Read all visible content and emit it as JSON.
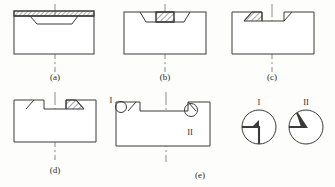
{
  "figure": {
    "title": "",
    "panels": [
      {
        "id": "a",
        "label": "(a)",
        "label_x": 55,
        "label_y": 80,
        "desc": "blank with full-width hatched top layer and trapezoidal preform outline",
        "body": {
          "x": 14,
          "y": 16,
          "w": 80,
          "h": 38
        },
        "centerline_x": 55,
        "cl_top": 4,
        "cl_bottom": 72,
        "top_strip": {
          "x": 14,
          "y": 11,
          "w": 80,
          "h": 5,
          "hatched": true
        },
        "trapezoid": {
          "x1": 30,
          "x2": 78,
          "x3": 72,
          "x4": 37,
          "y_top": 16,
          "y_bot": 24
        }
      },
      {
        "id": "b",
        "label": "(b)",
        "label_x": 165,
        "label_y": 80,
        "desc": "central hatched block seated in trapezoidal recess",
        "body": {
          "x": 124,
          "y": 12,
          "w": 82,
          "h": 42
        },
        "centerline_x": 165,
        "cl_top": 4,
        "cl_bottom": 72,
        "recess": {
          "x1": 140,
          "x2": 190,
          "x3": 184,
          "x4": 146,
          "y_top": 12,
          "y_bot": 22
        },
        "block": {
          "x": 156,
          "y": 12,
          "w": 18,
          "h": 10,
          "hatched": true
        }
      },
      {
        "id": "c",
        "label": "(c)",
        "label_x": 272,
        "label_y": 80,
        "desc": "stepped notch at top, hatched wedge on left shoulder",
        "body": {
          "x": 232,
          "y": 12,
          "w": 82,
          "h": 42
        },
        "centerline_x": 272,
        "cl_top": 4,
        "cl_bottom": 72,
        "notch": true,
        "wedge": {
          "hatched": true,
          "side": "left"
        }
      },
      {
        "id": "d",
        "label": "(d)",
        "label_x": 55,
        "label_y": 173,
        "desc": "mirrored stepped notch, hatched wedge on right shoulder",
        "body": {
          "x": 14,
          "y": 100,
          "w": 82,
          "h": 42
        },
        "centerline_x": 55,
        "cl_top": 92,
        "cl_bottom": 160,
        "notch": true,
        "wedge": {
          "hatched": true,
          "side": "right"
        }
      },
      {
        "id": "e",
        "label": "(e)",
        "label_x": 200,
        "label_y": 178,
        "desc": "finished section with two circled detail callouts I and II",
        "body": {
          "x": 116,
          "y": 102,
          "w": 94,
          "h": 44
        },
        "centerline_x": 166,
        "cl_top": 92,
        "cl_bottom": 162,
        "callouts": [
          {
            "tag": "I",
            "cx": 121,
            "cy": 107,
            "r": 5.5,
            "label_x": 111,
            "label_y": 101
          },
          {
            "tag": "II",
            "cx": 191,
            "cy": 110,
            "r": 6.5,
            "label_x": 190,
            "label_y": 133
          }
        ]
      }
    ],
    "details": [
      {
        "tag": "I",
        "label": "I",
        "cx": 259,
        "cy": 127,
        "r": 17,
        "label_x": 259,
        "label_y": 104,
        "desc": "enlarged view: square (90 degree) corner"
      },
      {
        "tag": "II",
        "label": "II",
        "cx": 306,
        "cy": 127,
        "r": 17,
        "label_x": 306,
        "label_y": 104,
        "desc": "enlarged view: acute tapered wedge tip"
      }
    ],
    "style": {
      "line_color": "#3a3a3a",
      "hatch_color": "#3a3a3a",
      "centerline_color": "#6e6e6e",
      "fill_color": "#ffffff",
      "background": "#fdfdfb"
    }
  }
}
